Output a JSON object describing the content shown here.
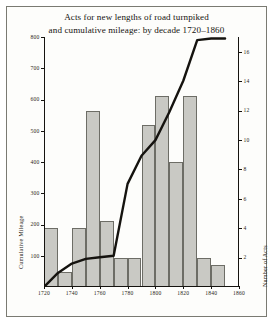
{
  "figure": {
    "title_line1": "Acts for new lengths of road turnpiked",
    "title_line2": "and cumulative mileage: by decade 1720–1860",
    "frame_color": "#7a7a72",
    "bar_fill": "#c9c9c4",
    "bar_stroke": "#6d6d66",
    "line_color": "#15130f"
  },
  "chart_data": {
    "type": "bar",
    "title": "Acts for new lengths of road turnpiked and cumulative mileage: by decade 1720–1860",
    "xlabel": "",
    "ylabel": "Cumulative Mileage",
    "y2label": "Number of Acts",
    "xlim": [
      1720,
      1860
    ],
    "ylim": [
      0,
      800
    ],
    "y2lim": [
      0,
      17
    ],
    "grid": false,
    "legend": "none",
    "xticks": [
      1720,
      1740,
      1760,
      1780,
      1800,
      1820,
      1840,
      1860
    ],
    "xtick_labels": [
      "1720",
      "1740",
      "1760",
      "1780",
      "1800",
      "1820",
      "1840",
      "1860"
    ],
    "yticks": [
      100,
      200,
      300,
      400,
      500,
      600,
      700,
      800
    ],
    "ytick_labels": [
      "100",
      "200",
      "300",
      "400",
      "500",
      "600",
      "700",
      "800"
    ],
    "y2ticks": [
      2,
      4,
      6,
      8,
      10,
      12,
      14,
      16
    ],
    "y2tick_labels": [
      "2",
      "4",
      "6",
      "8",
      "10",
      "12",
      "14",
      "16"
    ],
    "categories": [
      "1720",
      "1730",
      "1740",
      "1750",
      "1760",
      "1770",
      "1780",
      "1790",
      "1800",
      "1810",
      "1820",
      "1830",
      "1840"
    ],
    "series": [
      {
        "name": "Number of Acts",
        "axis": "right",
        "type": "bar",
        "values": [
          4,
          1,
          4,
          12,
          4.5,
          2,
          2,
          11,
          13,
          8.5,
          13,
          2,
          1.5
        ]
      },
      {
        "name": "Cumulative Mileage",
        "axis": "left",
        "type": "line",
        "x": [
          1720,
          1730,
          1740,
          1750,
          1760,
          1770,
          1780,
          1790,
          1800,
          1810,
          1820,
          1830,
          1840,
          1850
        ],
        "values": [
          0,
          45,
          75,
          90,
          95,
          100,
          330,
          420,
          470,
          560,
          660,
          790,
          795,
          795
        ]
      }
    ]
  }
}
